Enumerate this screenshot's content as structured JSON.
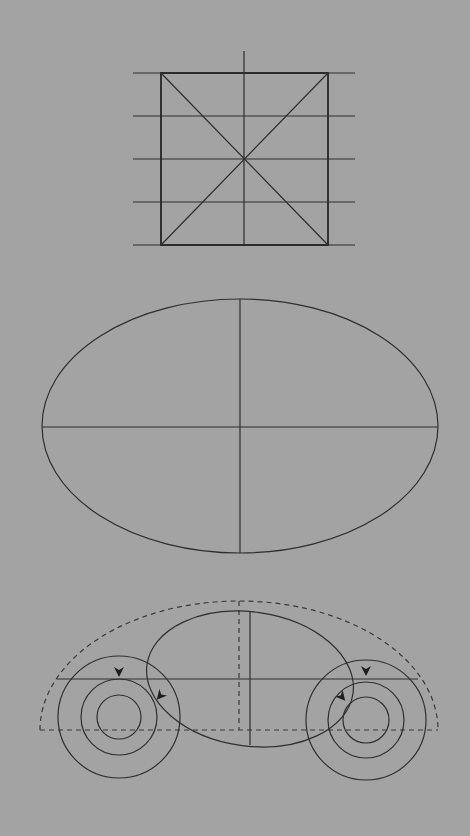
{
  "canvas": {
    "width": 470,
    "height": 836,
    "background": "#a3a3a3",
    "stroke": "#2e2e2e"
  },
  "figures": [
    {
      "id": "square-construction",
      "description": "Square with diagonals, vertical center line and five horizontal guide lines",
      "square": {
        "x1": 161,
        "y1": 73,
        "x2": 328,
        "y2": 245
      },
      "horizontal_guides_y": [
        73,
        116,
        159,
        202,
        245
      ],
      "guide_x_extent": [
        133,
        355
      ],
      "vertical_center": {
        "x": 244,
        "y1": 51,
        "y2": 245
      },
      "diagonals": true
    },
    {
      "id": "ellipse-axes",
      "description": "Ellipse with major and minor axes drawn",
      "center": {
        "x": 240,
        "y": 427
      },
      "rx": 198,
      "ry": 127
    },
    {
      "id": "car-construction",
      "description": "Car shape construction: dashed half-ellipse outline, body ellipse, two wheels of concentric circles, with direction arrows",
      "outline_half_ellipse": {
        "cx": 239,
        "cy": 730,
        "rx": 199,
        "ry": 129,
        "style": "dashed"
      },
      "baseline": {
        "y": 730,
        "x1": 40,
        "x2": 438,
        "style": "dashed"
      },
      "axle_line": {
        "y": 679,
        "x1": 57,
        "x2": 418,
        "style": "solid"
      },
      "body_ellipse": {
        "cx": 250,
        "cy": 679,
        "rx": 104,
        "ry": 67,
        "rotation": 8
      },
      "body_vertical": {
        "x": 250,
        "y1": 612,
        "y2": 745
      },
      "dashed_vertical": {
        "x": 239,
        "y1": 601,
        "y2": 730
      },
      "wheels": [
        {
          "name": "left-wheel",
          "cx": 119,
          "cy": 717,
          "radii": [
            61,
            38,
            22
          ]
        },
        {
          "name": "right-wheel",
          "cx": 366,
          "cy": 720,
          "radii": [
            60,
            38,
            23
          ]
        }
      ],
      "arrows": [
        {
          "name": "left-wheel-top-arrow",
          "x": 119,
          "y": 673,
          "angle": 0
        },
        {
          "name": "left-wheel-side-arrow",
          "x": 161,
          "y": 695,
          "angle": 35
        },
        {
          "name": "right-wheel-top-arrow",
          "x": 366,
          "y": 672,
          "angle": 0
        },
        {
          "name": "right-wheel-side-arrow",
          "x": 342,
          "y": 698,
          "angle": -40
        }
      ]
    }
  ]
}
